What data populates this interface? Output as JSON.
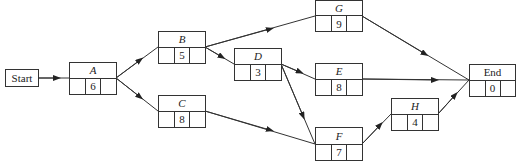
{
  "diagram": {
    "type": "activity-on-node network",
    "start": {
      "label": "Start"
    },
    "nodes": [
      {
        "id": "A",
        "label": "A",
        "duration": "6",
        "italic": true
      },
      {
        "id": "B",
        "label": "B",
        "duration": "5",
        "italic": true
      },
      {
        "id": "C",
        "label": "C",
        "duration": "8",
        "italic": true
      },
      {
        "id": "D",
        "label": "D",
        "duration": "3",
        "italic": true
      },
      {
        "id": "G",
        "label": "G",
        "duration": "9",
        "italic": true
      },
      {
        "id": "E",
        "label": "E",
        "duration": "8",
        "italic": true
      },
      {
        "id": "F",
        "label": "F",
        "duration": "7",
        "italic": true
      },
      {
        "id": "H",
        "label": "H",
        "duration": "4",
        "italic": true
      },
      {
        "id": "End",
        "label": "End",
        "duration": "0",
        "italic": false
      }
    ],
    "edges": [
      [
        "Start",
        "A"
      ],
      [
        "A",
        "B"
      ],
      [
        "A",
        "C"
      ],
      [
        "B",
        "G"
      ],
      [
        "B",
        "D"
      ],
      [
        "D",
        "E"
      ],
      [
        "D",
        "F"
      ],
      [
        "C",
        "F"
      ],
      [
        "G",
        "End"
      ],
      [
        "E",
        "End"
      ],
      [
        "F",
        "H"
      ],
      [
        "H",
        "End"
      ]
    ]
  }
}
